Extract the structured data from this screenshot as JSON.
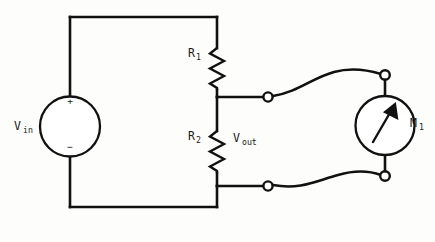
{
  "diagram": {
    "background_color": "#fdfdfb",
    "line_color": "#111111"
  },
  "source": {
    "label_main": "V",
    "label_sub": "in",
    "polarity_positive": "+",
    "polarity_negative": "−",
    "symbol": "voltage-source-circle"
  },
  "resistors": [
    {
      "id": "r1",
      "label_main": "R",
      "label_sub": "1",
      "symbol": "resistor-zigzag"
    },
    {
      "id": "r2",
      "label_main": "R",
      "label_sub": "2",
      "symbol": "resistor-zigzag"
    }
  ],
  "output": {
    "label_main": "V",
    "label_sub": "out"
  },
  "meter": {
    "label_main": "M",
    "label_sub": "1",
    "symbol": "meter-needle-circle"
  },
  "terminals": [
    {
      "id": "out-top",
      "symbol": "open-circle-terminal"
    },
    {
      "id": "out-bottom",
      "symbol": "open-circle-terminal"
    },
    {
      "id": "meter-top",
      "symbol": "open-circle-terminal"
    },
    {
      "id": "meter-bottom",
      "symbol": "open-circle-terminal"
    }
  ]
}
